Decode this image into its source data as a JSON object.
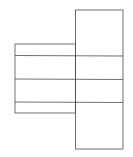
{
  "diagram": {
    "type": "box-net",
    "stroke_color": "#4a4a4a",
    "background": "#ffffff",
    "right_panel": {
      "x": 75.5,
      "y": 10,
      "width": 47.5,
      "height": 139
    },
    "left_panel": {
      "x": 15,
      "y": 44,
      "width": 60.5,
      "height": 69
    },
    "horizontal_lines": [
      {
        "x1": 15,
        "y1": 55.5,
        "x2": 123,
        "y2": 56
      },
      {
        "x1": 15,
        "y1": 79,
        "x2": 123,
        "y2": 79.5
      },
      {
        "x1": 15,
        "y1": 102,
        "x2": 123,
        "y2": 102.5
      }
    ]
  }
}
